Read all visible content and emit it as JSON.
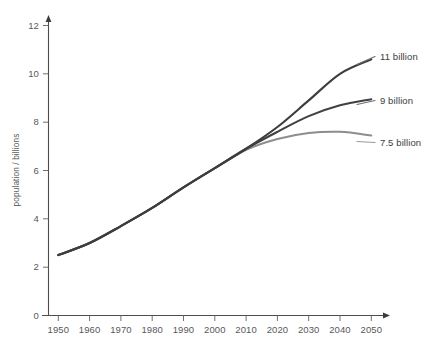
{
  "chart_data": {
    "type": "line",
    "title": "",
    "xlabel": "",
    "ylabel": "population / billions",
    "xlim": [
      1950,
      2050
    ],
    "ylim": [
      0,
      12
    ],
    "grid": false,
    "legend_position": "right-inline-annotations",
    "x_ticks": [
      "1950",
      "1960",
      "1970",
      "1980",
      "1990",
      "2000",
      "2010",
      "2020",
      "2030",
      "2040",
      "2050"
    ],
    "y_ticks": [
      "0",
      "2",
      "4",
      "6",
      "8",
      "10",
      "12"
    ],
    "x": [
      1950,
      1960,
      1970,
      1980,
      1990,
      2000,
      2010,
      2020,
      2030,
      2040,
      2050
    ],
    "series": [
      {
        "name": "11 billion",
        "label": "11 billion",
        "color": "#3d3d3f",
        "values": [
          2.5,
          3.0,
          3.7,
          4.45,
          5.3,
          6.1,
          6.9,
          7.8,
          8.9,
          10.0,
          10.6
        ]
      },
      {
        "name": "9 billion",
        "label": "9 billion",
        "color": "#414143",
        "values": [
          2.5,
          3.0,
          3.7,
          4.45,
          5.3,
          6.1,
          6.9,
          7.6,
          8.25,
          8.7,
          8.95
        ]
      },
      {
        "name": "7.5 billion",
        "label": "7.5 billion",
        "color": "#8d8d8f",
        "values": [
          2.5,
          3.0,
          3.7,
          4.45,
          5.3,
          6.1,
          6.85,
          7.3,
          7.55,
          7.6,
          7.45
        ]
      }
    ],
    "annotations": [
      {
        "text": "11 billion",
        "at_x": 2050,
        "at_y": 10.6
      },
      {
        "text": "9 billion",
        "at_x": 2050,
        "at_y": 8.95
      },
      {
        "text": "7.5 billion",
        "at_x": 2050,
        "at_y": 7.45
      }
    ]
  },
  "axes": {
    "y_label": "population / billions",
    "y_tick_0": "0",
    "y_tick_1": "2",
    "y_tick_2": "4",
    "y_tick_3": "6",
    "y_tick_4": "8",
    "y_tick_5": "10",
    "y_tick_6": "12",
    "x_tick_0": "1950",
    "x_tick_1": "1960",
    "x_tick_2": "1970",
    "x_tick_3": "1980",
    "x_tick_4": "1990",
    "x_tick_5": "2000",
    "x_tick_6": "2010",
    "x_tick_7": "2020",
    "x_tick_8": "2030",
    "x_tick_9": "2040",
    "x_tick_10": "2050"
  },
  "labels": {
    "high": "11 billion",
    "medium": "9 billion",
    "low": "7.5 billion"
  },
  "colors": {
    "line_dark": "#3d3d3f",
    "line_light": "#8d8d8f",
    "axis": "#4d4d4d",
    "tick_text": "#58585a",
    "background": "#ffffff"
  }
}
